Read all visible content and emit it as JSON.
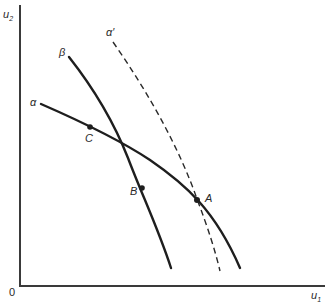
{
  "diagram": {
    "axes": {
      "x_label": "u",
      "x_label_subscript": "1",
      "y_label": "u",
      "y_label_subscript": "2",
      "origin_label": "0"
    },
    "curves": [
      {
        "id": "alpha",
        "label": "α",
        "style": "solid"
      },
      {
        "id": "beta",
        "label": "β",
        "style": "solid"
      },
      {
        "id": "alpha-prime",
        "label": "α′",
        "style": "dashed"
      }
    ],
    "points": [
      {
        "id": "A",
        "label": "A"
      },
      {
        "id": "B",
        "label": "B"
      },
      {
        "id": "C",
        "label": "C"
      }
    ]
  }
}
